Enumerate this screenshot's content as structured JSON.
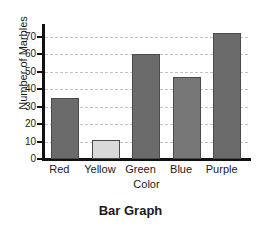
{
  "chart_data": {
    "type": "bar",
    "title": "Bar Graph",
    "xlabel": "Color",
    "ylabel": "Number of Marbles",
    "categories": [
      "Red",
      "Yellow",
      "Green",
      "Blue",
      "Purple"
    ],
    "values": [
      35,
      11,
      60,
      47,
      72
    ],
    "ylim": [
      0,
      75
    ],
    "yticks": [
      0,
      10,
      20,
      30,
      40,
      50,
      60,
      70
    ],
    "ytick_labels": [
      "0",
      "10",
      "20",
      "30",
      "40",
      "50",
      "60",
      "70"
    ],
    "grid": "horizontal-dashed",
    "legend": "none",
    "bar_colors": [
      "#6b6b6b",
      "#d9d9d9",
      "#6b6b6b",
      "#777777",
      "#6b6b6b"
    ],
    "bar_border_color": "#4a4a4a",
    "axis_color": "#111111",
    "gridline_color": "#c2c2c2",
    "background": "#ffffff"
  }
}
